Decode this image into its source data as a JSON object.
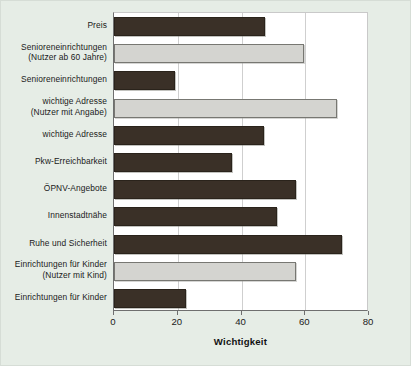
{
  "chart_data": {
    "type": "bar",
    "orientation": "horizontal",
    "title": "",
    "xlabel": "Wichtigkeit",
    "ylabel": "",
    "xlim": [
      0,
      80
    ],
    "xticks": [
      0,
      20,
      40,
      60,
      80
    ],
    "xtick_labels": [
      "0",
      "20",
      "40",
      "60",
      "80"
    ],
    "grid": true,
    "grid_axis": "x",
    "legend": "none",
    "categories": [
      "Preis",
      "Senioreneinrichtungen (Nutzer ab 60 Jahre)",
      "Senioreneinrichtungen",
      "wichtige Adresse (Nutzer mit Angabe)",
      "wichtige Adresse",
      "Pkw-Erreichbarkeit",
      "ÖPNV-Angebote",
      "Innenstadtnähe",
      "Ruhe und Sicherheit",
      "Einrichtungen für Kinder (Nutzer mit Kind)",
      "Einrichtungen für Kinder"
    ],
    "values": [
      47.5,
      59.5,
      19,
      70,
      47,
      37,
      57,
      51,
      71.5,
      57,
      22.5
    ],
    "bars": [
      {
        "label_line1": "Preis",
        "label_line2": "",
        "value": 47.5,
        "style": "dark"
      },
      {
        "label_line1": "Senioreneinrichtungen",
        "label_line2": "(Nutzer ab 60 Jahre)",
        "value": 59.5,
        "style": "light"
      },
      {
        "label_line1": "Senioreneinrichtungen",
        "label_line2": "",
        "value": 19,
        "style": "dark"
      },
      {
        "label_line1": "wichtige Adresse",
        "label_line2": "(Nutzer mit Angabe)",
        "value": 70,
        "style": "light"
      },
      {
        "label_line1": "wichtige Adresse",
        "label_line2": "",
        "value": 47,
        "style": "dark"
      },
      {
        "label_line1": "Pkw-Erreichbarkeit",
        "label_line2": "",
        "value": 37,
        "style": "dark"
      },
      {
        "label_line1": "ÖPNV-Angebote",
        "label_line2": "",
        "value": 57,
        "style": "dark"
      },
      {
        "label_line1": "Innenstadtnähe",
        "label_line2": "",
        "value": 51,
        "style": "dark"
      },
      {
        "label_line1": "Ruhe und Sicherheit",
        "label_line2": "",
        "value": 71.5,
        "style": "dark"
      },
      {
        "label_line1": "Einrichtungen für Kinder",
        "label_line2": "(Nutzer mit Kind)",
        "value": 57,
        "style": "light"
      },
      {
        "label_line1": "Einrichtungen für Kinder",
        "label_line2": "",
        "value": 22.5,
        "style": "dark"
      }
    ],
    "colors": {
      "bar_dark": "#3a3027",
      "bar_light": "#d4d4d0",
      "background": "#e6ede6",
      "plot_background": "#ffffff",
      "axis": "#6f6f6f",
      "grid": "#cfcfcf"
    }
  }
}
